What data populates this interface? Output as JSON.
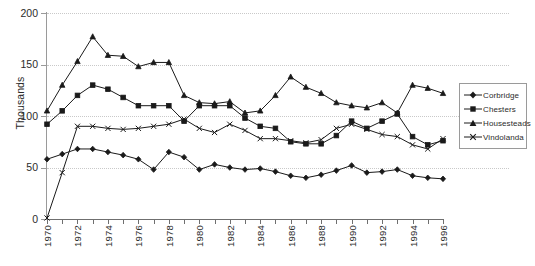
{
  "chart_data": {
    "type": "line",
    "title": "",
    "xlabel": "",
    "ylabel": "Thousands",
    "xlim": [
      1970,
      1996
    ],
    "ylim": [
      0,
      200
    ],
    "yticks": [
      0,
      50,
      100,
      150,
      200
    ],
    "grid": "horizontal dotted",
    "legend_position": "right",
    "x": [
      1970,
      1971,
      1972,
      1973,
      1974,
      1975,
      1976,
      1977,
      1978,
      1979,
      1980,
      1981,
      1982,
      1983,
      1984,
      1985,
      1986,
      1987,
      1988,
      1989,
      1990,
      1991,
      1992,
      1993,
      1994,
      1995,
      1996
    ],
    "categories": [
      "1970",
      "1971",
      "1972",
      "1973",
      "1974",
      "1975",
      "1976",
      "1977",
      "1978",
      "1979",
      "1980",
      "1981",
      "1982",
      "1983",
      "1984",
      "1985",
      "1986",
      "1987",
      "1988",
      "1989",
      "1990",
      "1991",
      "1992",
      "1993",
      "1994",
      "1995",
      "1996"
    ],
    "x_tick_labels": [
      "1970",
      "1972",
      "1974",
      "1976",
      "1978",
      "1980",
      "1982",
      "1984",
      "1986",
      "1988",
      "1990",
      "1992",
      "1994",
      "1996"
    ],
    "series": [
      {
        "name": "Corbridge",
        "marker": "diamond",
        "values": [
          58,
          63,
          68,
          68,
          65,
          62,
          58,
          48,
          65,
          60,
          48,
          53,
          50,
          48,
          49,
          46,
          42,
          40,
          43,
          47,
          52,
          45,
          46,
          48,
          42,
          40,
          39
        ]
      },
      {
        "name": "Chesters",
        "marker": "square",
        "values": [
          92,
          105,
          120,
          130,
          126,
          118,
          110,
          110,
          110,
          95,
          110,
          110,
          110,
          98,
          90,
          88,
          75,
          73,
          73,
          81,
          95,
          88,
          95,
          102,
          80,
          72,
          76
        ]
      },
      {
        "name": "Housesteads",
        "marker": "triangle",
        "values": [
          105,
          130,
          153,
          177,
          159,
          158,
          148,
          152,
          152,
          120,
          113,
          112,
          114,
          103,
          105,
          120,
          138,
          128,
          122,
          113,
          110,
          108,
          113,
          103,
          130,
          127,
          122
        ]
      },
      {
        "name": "Vindolanda",
        "marker": "x",
        "values": [
          1,
          45,
          90,
          90,
          88,
          87,
          88,
          90,
          92,
          97,
          88,
          84,
          92,
          86,
          78,
          78,
          76,
          74,
          77,
          88,
          92,
          87,
          82,
          80,
          72,
          68,
          78
        ]
      }
    ]
  },
  "legend": {
    "items": [
      {
        "label": "Corbridge"
      },
      {
        "label": "Chesters"
      },
      {
        "label": "Housesteads"
      },
      {
        "label": "Vindolanda"
      }
    ]
  },
  "axis": {
    "y_title": "Thousands",
    "y_labels": [
      "200",
      "150",
      "100",
      "50",
      "0"
    ],
    "x_labels": [
      "1970",
      "1972",
      "1974",
      "1976",
      "1978",
      "1980",
      "1982",
      "1984",
      "1986",
      "1988",
      "1990",
      "1992",
      "1994",
      "1996"
    ]
  },
  "colors": {
    "line": "#1a1a1a",
    "grid": "#c9c9c9",
    "axis": "#6f6f6f",
    "text": "#2b2b2b"
  }
}
